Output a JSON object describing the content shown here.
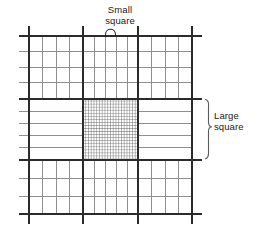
{
  "figure": {
    "type": "hemocytometer-grid-diagram",
    "title": "",
    "annotations": [
      {
        "id": "small-square",
        "text": "Small\nsquare",
        "pointer": "arc-brace-down",
        "position": "top-center"
      },
      {
        "id": "large-square",
        "text": "Large\nsquare",
        "pointer": "vertical-brace-left",
        "position": "right-middle"
      }
    ],
    "grid": {
      "outer_bounds": {
        "x0": 29,
        "y0": 36,
        "x1": 192,
        "y1": 214
      },
      "tick_overhang": 10,
      "major_cols_x": [
        29,
        83,
        138,
        192
      ],
      "major_rows_y": [
        36,
        99,
        160,
        214
      ],
      "minor_line_color": "#8c8c8c",
      "major_line_color": "#2b2b2b",
      "minor_line_width": 1,
      "major_line_width": 2,
      "top_band_minor_cols": 3,
      "middle_band_minor_rows": 4,
      "center_fine_grid_divisions": 20,
      "center_fine_grid_bounds": {
        "x0": 83,
        "y0": 99,
        "x1": 138,
        "y1": 160
      },
      "center_fine_color": "#555555"
    },
    "colors": {
      "background": "#ffffff",
      "ink": "#1a1a1a",
      "major": "#2b2b2b",
      "minor": "#8c8c8c",
      "fine": "#555555"
    }
  }
}
